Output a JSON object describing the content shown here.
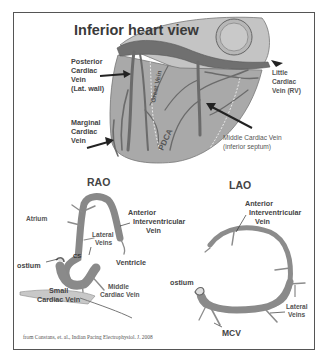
{
  "figure": {
    "top_panel": {
      "title": "Inferior heart view",
      "labels": {
        "posterior": [
          "Posterior",
          "Cardiac",
          "Vein",
          "(Lat. wall)"
        ],
        "marginal": [
          "Marginal",
          "Cardiac",
          "Vein"
        ],
        "little": [
          "Little",
          "Cardiac",
          "Vein (RV)"
        ],
        "middle": [
          "Middle Cardiac Vein",
          "(inferior septum)"
        ],
        "great_vein": "Great Vein",
        "pdca": "PDCA"
      }
    },
    "rao_panel": {
      "title": "RAO",
      "labels": {
        "atrium": "Atrium",
        "anterior": [
          "Anterior",
          "Interventricular",
          "Vein"
        ],
        "lateral": [
          "Lateral",
          "Veins"
        ],
        "cs": "CS",
        "ostium": "ostium",
        "ventricle": "Ventricle",
        "middle": [
          "Middle",
          "Cardiac Vein"
        ],
        "small": [
          "Small",
          "Cardiac Vein"
        ]
      }
    },
    "lao_panel": {
      "title": "LAO",
      "labels": {
        "anterior": [
          "Anterior",
          "Interventricular",
          "Vein"
        ],
        "ostium": "ostium",
        "lateral": [
          "Lateral",
          "Veins"
        ],
        "mcv": "MCV"
      }
    },
    "caption": "from Constans, et. al., Indian Pacing Electrophysiol. J. 2008",
    "colors": {
      "heart_fill": "#a9a9a9",
      "vein_dark": "#6f6f6f",
      "vein_mid": "#8c8c8c",
      "frame": "#555555"
    }
  }
}
